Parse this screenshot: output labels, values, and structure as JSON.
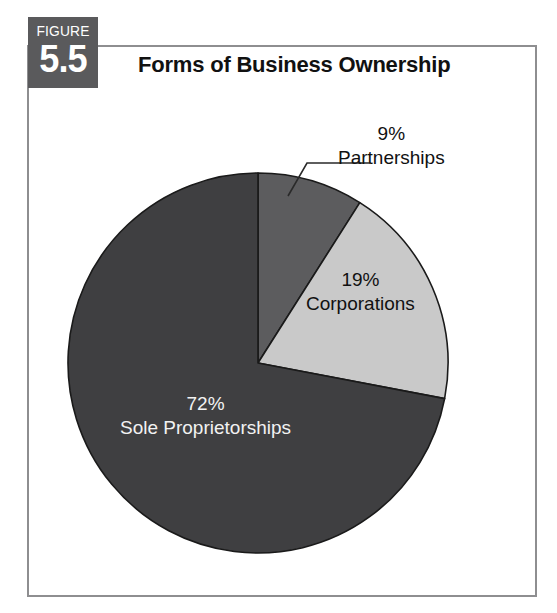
{
  "figure": {
    "badge_word": "FIGURE",
    "badge_number": "5.5",
    "title": "Forms of Business Ownership"
  },
  "colors": {
    "badge_bg": "#5a5a5c",
    "frame_border": "#8e8e90",
    "slice_sole": "#3f3f41",
    "slice_corporations": "#c9c9c9",
    "slice_partnerships": "#5c5c5e",
    "slice_outline": "#1a1a1a",
    "leader_line": "#2a2a2a",
    "label_dark": "#111111",
    "label_light": "#f2f2f2"
  },
  "chart_data": {
    "type": "pie",
    "title": "Forms of Business Ownership",
    "xlabel": "",
    "ylabel": "",
    "legend_position": "none",
    "grid": false,
    "start_angle_deg": 0,
    "direction": "clockwise",
    "categories": [
      "Partnerships",
      "Corporations",
      "Sole Proprietorships"
    ],
    "values": [
      9,
      19,
      72
    ],
    "unit": "%",
    "slices": [
      {
        "label": "Partnerships",
        "value": 9,
        "pct_text": "9%",
        "color": "#5c5c5e",
        "label_placement": "outside",
        "has_leader_line": true,
        "text_color": "#111111"
      },
      {
        "label": "Corporations",
        "value": 19,
        "pct_text": "19%",
        "color": "#c9c9c9",
        "label_placement": "inside",
        "has_leader_line": false,
        "text_color": "#111111"
      },
      {
        "label": "Sole Proprietorships",
        "value": 72,
        "pct_text": "72%",
        "color": "#3f3f41",
        "label_placement": "inside",
        "has_leader_line": false,
        "text_color": "#f2f2f2"
      }
    ]
  }
}
